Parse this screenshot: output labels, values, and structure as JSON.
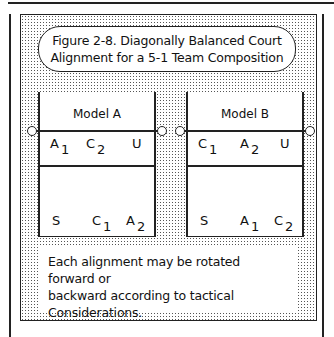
{
  "figure": {
    "title_line1": "Figure 2-8. Diagonally Balanced Court",
    "title_line2": "Alignment for a 5-1 Team Composition"
  },
  "models": [
    {
      "label": "Model A",
      "front": [
        {
          "p": "A",
          "s": "1"
        },
        {
          "p": "C",
          "s": "2"
        },
        {
          "p": "U",
          "s": ""
        }
      ],
      "back": [
        {
          "p": "S",
          "s": ""
        },
        {
          "p": "C",
          "s": "1"
        },
        {
          "p": "A",
          "s": "2"
        }
      ]
    },
    {
      "label": "Model B",
      "front": [
        {
          "p": "C",
          "s": "1"
        },
        {
          "p": "A",
          "s": "2"
        },
        {
          "p": "U",
          "s": ""
        }
      ],
      "back": [
        {
          "p": "S",
          "s": ""
        },
        {
          "p": "A",
          "s": "1"
        },
        {
          "p": "C",
          "s": "2"
        }
      ]
    }
  ],
  "note": {
    "line1": "Each alignment may be rotated forward or",
    "line2": "backward according to tactical",
    "line3": "Considerations."
  }
}
